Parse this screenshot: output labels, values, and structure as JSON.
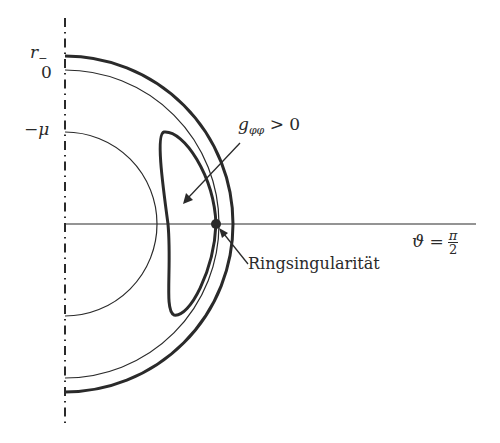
{
  "diagram": {
    "title": "",
    "axis_labels": {
      "r_minus": {
        "base": "r",
        "sub": "−"
      },
      "zero": "0",
      "minus_mu": "−μ"
    },
    "annotations": {
      "g_phiphi": {
        "base": "g",
        "sub": "φφ",
        "rest": " > 0"
      },
      "theta": {
        "lhs": "ϑ =",
        "num": "π",
        "den": "2"
      },
      "ring": "Ringsingularität"
    },
    "colors": {
      "stroke": "#2a2a2a",
      "background": "#ffffff"
    },
    "geometry": {
      "axis_x": 65,
      "center_y": 224,
      "outer_radius": 168,
      "middle_radius": 154,
      "inner_radius": 92,
      "singularity_point": [
        216,
        224
      ]
    }
  }
}
